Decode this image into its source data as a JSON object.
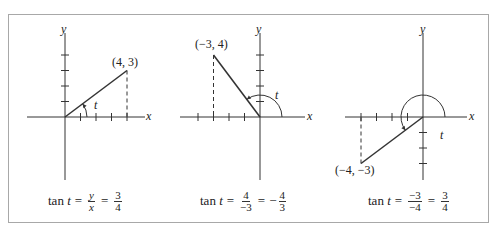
{
  "figure": {
    "border_color": "#a8a8a8",
    "line_color": "#333333",
    "panels": [
      {
        "id": "quadrant-1",
        "point": [
          4,
          3
        ],
        "point_label": "(4, 3)",
        "angle_label": "t",
        "axis_x_label": "x",
        "axis_y_label": "y",
        "caption": {
          "prefix": "tan",
          "var": "t",
          "frac1_num": "y",
          "frac1_den": "x",
          "frac1_italic": true,
          "rhs_sign": "",
          "frac2_num": "3",
          "frac2_den": "4"
        }
      },
      {
        "id": "quadrant-2",
        "point": [
          -3,
          4
        ],
        "point_label": "(−3, 4)",
        "angle_label": "t",
        "axis_x_label": "x",
        "axis_y_label": "y",
        "caption": {
          "prefix": "tan",
          "var": "t",
          "frac1_num": "4",
          "frac1_den": "−3",
          "frac1_italic": false,
          "rhs_sign": "−",
          "frac2_num": "4",
          "frac2_den": "3"
        }
      },
      {
        "id": "quadrant-3",
        "point": [
          -4,
          -3
        ],
        "point_label": "(−4, −3)",
        "angle_label": "t",
        "axis_x_label": "x",
        "axis_y_label": "y",
        "caption": {
          "prefix": "tan",
          "var": "t",
          "frac1_num": "−3",
          "frac1_den": "−4",
          "frac1_italic": false,
          "rhs_sign": "",
          "frac2_num": "3",
          "frac2_den": "4"
        }
      }
    ]
  }
}
